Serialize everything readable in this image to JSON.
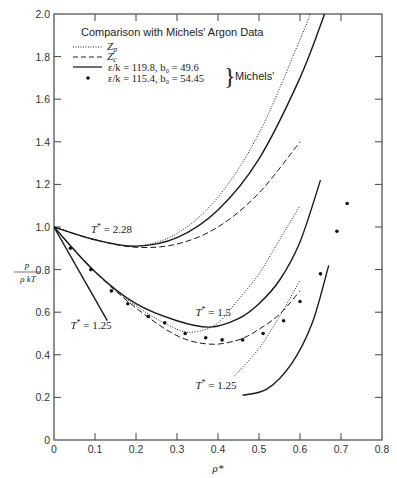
{
  "chart_data": {
    "type": "line",
    "title": "Comparison with Michels' Argon Data",
    "xlabel": "ρ*",
    "ylabel": "p / ρkT",
    "xlim": [
      0,
      0.8
    ],
    "ylim": [
      0,
      2.0
    ],
    "grid": false,
    "legend_position": "upper-left",
    "x_ticks": [
      "0",
      "0.1",
      "0.2",
      "0.3",
      "0.4",
      "0.5",
      "0.6",
      "0.7",
      "0.8"
    ],
    "y_ticks": [
      "0",
      "0.2",
      "0.4",
      "0.6",
      "0.8",
      "1.0",
      "1.2",
      "1.4",
      "1.6",
      "1.8",
      "2.0"
    ],
    "legend": [
      {
        "style": "dotted",
        "label": "Z_p"
      },
      {
        "style": "dashed",
        "label": "Z_c"
      },
      {
        "style": "solid",
        "label": "ε/k = 119.8, b₀ = 49.6"
      },
      {
        "style": "dot-marker",
        "label": "ε/k = 115.4, b₀ = 54.45"
      }
    ],
    "legend_group_label": "Michels'",
    "annotations": [
      {
        "text": "T* = 2.28",
        "x": 0.09,
        "y": 0.97
      },
      {
        "text": "T* = 1.5",
        "x": 0.345,
        "y": 0.58
      },
      {
        "text": "T* = 1.25",
        "x": 0.345,
        "y": 0.24
      },
      {
        "text": "T* = 1.25",
        "x": 0.04,
        "y": 0.52
      }
    ],
    "series": [
      {
        "name": "T*=2.28 Z_p",
        "style": "dotted",
        "x": [
          0,
          0.1,
          0.2,
          0.3,
          0.4,
          0.5,
          0.6,
          0.625
        ],
        "y": [
          1.0,
          0.94,
          0.91,
          0.97,
          1.14,
          1.44,
          1.88,
          2.0
        ]
      },
      {
        "name": "T*=2.28 solid",
        "style": "solid",
        "x": [
          0,
          0.1,
          0.2,
          0.3,
          0.4,
          0.5,
          0.6,
          0.66
        ],
        "y": [
          1.0,
          0.94,
          0.91,
          0.95,
          1.08,
          1.32,
          1.7,
          2.0
        ]
      },
      {
        "name": "T*=2.28 Z_c",
        "style": "dashed",
        "x": [
          0,
          0.1,
          0.2,
          0.3,
          0.4,
          0.5,
          0.6
        ],
        "y": [
          1.0,
          0.94,
          0.905,
          0.92,
          1.0,
          1.16,
          1.4
        ]
      },
      {
        "name": "T*=1.5 Z_p",
        "style": "dotted",
        "x": [
          0,
          0.1,
          0.2,
          0.3,
          0.35,
          0.4,
          0.45,
          0.5,
          0.55,
          0.6
        ],
        "y": [
          1.0,
          0.79,
          0.63,
          0.52,
          0.51,
          0.55,
          0.66,
          0.78,
          0.94,
          1.1
        ]
      },
      {
        "name": "T*=1.5 solid",
        "style": "solid",
        "x": [
          0,
          0.1,
          0.2,
          0.3,
          0.38,
          0.45,
          0.5,
          0.55,
          0.6,
          0.65
        ],
        "y": [
          1.0,
          0.79,
          0.64,
          0.56,
          0.53,
          0.57,
          0.64,
          0.75,
          0.93,
          1.22
        ]
      },
      {
        "name": "T*=1.5 Z_c",
        "style": "dashed",
        "x": [
          0,
          0.1,
          0.2,
          0.3,
          0.38,
          0.45,
          0.5,
          0.55,
          0.6
        ],
        "y": [
          1.0,
          0.79,
          0.62,
          0.49,
          0.45,
          0.47,
          0.52,
          0.59,
          0.7
        ]
      },
      {
        "name": "T*=1.25 Z_p",
        "style": "dotted",
        "x": [
          0.44,
          0.5,
          0.55,
          0.6
        ],
        "y": [
          0.3,
          0.43,
          0.58,
          0.75
        ]
      },
      {
        "name": "T*=1.25 solid",
        "style": "solid",
        "x": [
          0.46,
          0.52,
          0.58,
          0.63,
          0.67
        ],
        "y": [
          0.21,
          0.24,
          0.36,
          0.55,
          0.82
        ]
      },
      {
        "name": "T*=1.25 low-density solid",
        "style": "solid",
        "x": [
          0,
          0.13
        ],
        "y": [
          1.0,
          0.56
        ]
      },
      {
        "name": "Michels' data",
        "style": "dot-marker",
        "x": [
          0.04,
          0.09,
          0.14,
          0.18,
          0.23,
          0.27,
          0.32,
          0.37,
          0.41,
          0.46,
          0.51,
          0.56,
          0.6,
          0.65,
          0.69,
          0.715
        ],
        "y": [
          0.9,
          0.8,
          0.7,
          0.64,
          0.58,
          0.55,
          0.5,
          0.48,
          0.47,
          0.47,
          0.5,
          0.56,
          0.65,
          0.78,
          0.98,
          1.11
        ]
      }
    ]
  }
}
